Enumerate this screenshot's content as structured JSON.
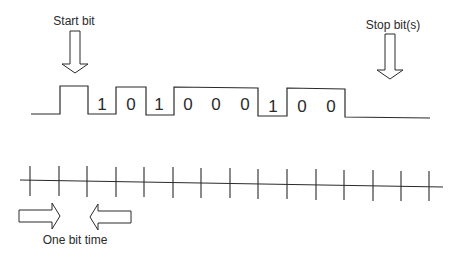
{
  "diagram": {
    "labels": {
      "start_bit": "Start bit",
      "stop_bits": "Stop bit(s)",
      "one_bit_time": "One bit time"
    },
    "data_bits": [
      "1",
      "0",
      "1",
      "0",
      "0",
      "0",
      "1",
      "0",
      "0"
    ],
    "colors": {
      "stroke": "#2a2a2a",
      "background": "#ffffff"
    }
  }
}
